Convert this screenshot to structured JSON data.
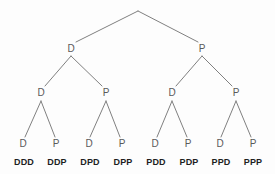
{
  "diagram": {
    "kind": "probability-tree-diagram",
    "width": 275,
    "height": 174,
    "background_color": "#fdfdfd",
    "edge_color": "#808080",
    "node_text_color": "#5a5a5a",
    "outcome_text_color": "#1f1f1f"
  },
  "chart_data": {
    "type": "diagram",
    "title": "",
    "tree": {
      "levels": 3,
      "branch_labels": [
        "D",
        "P"
      ],
      "root": {
        "label": "",
        "x": 138,
        "y": 11
      },
      "level1": [
        {
          "label": "D",
          "x": 71,
          "y": 49
        },
        {
          "label": "P",
          "x": 202,
          "y": 49
        }
      ],
      "level2": [
        {
          "label": "D",
          "x": 41,
          "y": 93
        },
        {
          "label": "P",
          "x": 106,
          "y": 93
        },
        {
          "label": "D",
          "x": 172,
          "y": 93
        },
        {
          "label": "P",
          "x": 236,
          "y": 93
        }
      ],
      "level3": [
        {
          "label": "D",
          "x": 23,
          "y": 144
        },
        {
          "label": "P",
          "x": 56,
          "y": 144
        },
        {
          "label": "D",
          "x": 89,
          "y": 144
        },
        {
          "label": "P",
          "x": 122,
          "y": 144
        },
        {
          "label": "D",
          "x": 155,
          "y": 144
        },
        {
          "label": "P",
          "x": 188,
          "y": 144
        },
        {
          "label": "D",
          "x": 220,
          "y": 144
        },
        {
          "label": "P",
          "x": 253,
          "y": 144
        }
      ],
      "outcomes": [
        {
          "label": "DDD",
          "x": 24,
          "y": 163
        },
        {
          "label": "DDP",
          "x": 57,
          "y": 163
        },
        {
          "label": "DPD",
          "x": 90,
          "y": 163
        },
        {
          "label": "DPP",
          "x": 123,
          "y": 163
        },
        {
          "label": "PDD",
          "x": 156,
          "y": 163
        },
        {
          "label": "PDP",
          "x": 189,
          "y": 163
        },
        {
          "label": "PPD",
          "x": 221,
          "y": 163
        },
        {
          "label": "PPP",
          "x": 253,
          "y": 163
        }
      ],
      "edges": [
        {
          "from": "root",
          "to": "level1-0",
          "x1": 138,
          "y1": 11,
          "x2": 76,
          "y2": 42
        },
        {
          "from": "root",
          "to": "level1-1",
          "x1": 138,
          "y1": 11,
          "x2": 198,
          "y2": 42
        },
        {
          "from": "level1-0",
          "to": "level2-0",
          "x1": 71,
          "y1": 56,
          "x2": 45,
          "y2": 86
        },
        {
          "from": "level1-0",
          "to": "level2-1",
          "x1": 71,
          "y1": 56,
          "x2": 102,
          "y2": 86
        },
        {
          "from": "level1-1",
          "to": "level2-2",
          "x1": 202,
          "y1": 56,
          "x2": 176,
          "y2": 86
        },
        {
          "from": "level1-1",
          "to": "level2-3",
          "x1": 202,
          "y1": 56,
          "x2": 232,
          "y2": 86
        },
        {
          "from": "level2-0",
          "to": "level3-0",
          "x1": 41,
          "y1": 101,
          "x2": 25,
          "y2": 137
        },
        {
          "from": "level2-0",
          "to": "level3-1",
          "x1": 41,
          "y1": 101,
          "x2": 55,
          "y2": 137
        },
        {
          "from": "level2-1",
          "to": "level3-2",
          "x1": 106,
          "y1": 101,
          "x2": 90,
          "y2": 137
        },
        {
          "from": "level2-1",
          "to": "level3-3",
          "x1": 106,
          "y1": 101,
          "x2": 120,
          "y2": 137
        },
        {
          "from": "level2-2",
          "to": "level3-4",
          "x1": 172,
          "y1": 101,
          "x2": 157,
          "y2": 137
        },
        {
          "from": "level2-2",
          "to": "level3-5",
          "x1": 172,
          "y1": 101,
          "x2": 187,
          "y2": 137
        },
        {
          "from": "level2-3",
          "to": "level3-6",
          "x1": 236,
          "y1": 101,
          "x2": 221,
          "y2": 137
        },
        {
          "from": "level2-3",
          "to": "level3-7",
          "x1": 236,
          "y1": 101,
          "x2": 251,
          "y2": 137
        }
      ]
    }
  }
}
